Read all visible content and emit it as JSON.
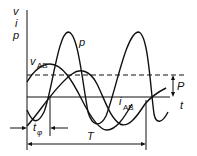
{
  "diagram": {
    "axis_labels": {
      "v": "v",
      "i": "i",
      "p": "p",
      "t": "t"
    },
    "curve_labels": {
      "p": "p",
      "v_main": "v",
      "v_sub": "AB",
      "i_main": "i",
      "i_sub": "AB"
    },
    "annotations": {
      "average_power": "P",
      "phase_shift_main": "t",
      "phase_shift_sub": "φ",
      "period": "T"
    },
    "colors": {
      "stroke": "#111111",
      "background": "#ffffff"
    }
  }
}
